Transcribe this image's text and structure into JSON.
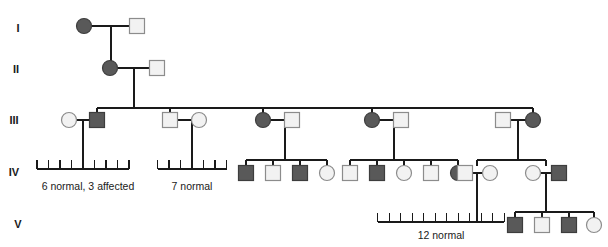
{
  "figure": {
    "type": "pedigree-chart",
    "width": 608,
    "height": 247,
    "background": "#ffffff",
    "line_color": "#1a1a1a",
    "affected_fill": "#595959",
    "unaffected_fill": "#f2f2f2",
    "symbol_stroke": "#8c8c8c",
    "affected_stroke": "#3d3d3d"
  },
  "generation_labels": [
    {
      "id": "gen-1",
      "text": "I",
      "x": 18,
      "y": 32
    },
    {
      "id": "gen-2",
      "text": "II",
      "x": 16,
      "y": 73
    },
    {
      "id": "gen-3",
      "text": "III",
      "x": 14,
      "y": 124
    },
    {
      "id": "gen-4",
      "text": "IV",
      "x": 14,
      "y": 176
    },
    {
      "id": "gen-5",
      "text": "V",
      "x": 18,
      "y": 228
    }
  ],
  "sibship_labels": [
    {
      "id": "sibship-label-1",
      "text": "6 normal, 3 affected",
      "x": 88,
      "y": 190,
      "count": 9
    },
    {
      "id": "sibship-label-2",
      "text": "7 normal",
      "x": 192,
      "y": 190,
      "count": 7
    },
    {
      "id": "sibship-label-3",
      "text": "12 normal",
      "x": 441,
      "y": 239,
      "count": 12
    }
  ],
  "individuals": [
    {
      "id": "I-1",
      "shape": "circle",
      "status": "affected",
      "x": 84,
      "y": 26,
      "generation": "I"
    },
    {
      "id": "I-2",
      "shape": "square",
      "status": "unaffected",
      "x": 137,
      "y": 26,
      "generation": "I"
    },
    {
      "id": "II-1",
      "shape": "circle",
      "status": "affected",
      "x": 110,
      "y": 68,
      "generation": "II"
    },
    {
      "id": "II-2",
      "shape": "square",
      "status": "unaffected",
      "x": 157,
      "y": 68,
      "generation": "II"
    },
    {
      "id": "III-1",
      "shape": "circle",
      "status": "unaffected",
      "x": 69,
      "y": 120,
      "generation": "III"
    },
    {
      "id": "III-2",
      "shape": "square",
      "status": "affected",
      "x": 97,
      "y": 120,
      "generation": "III"
    },
    {
      "id": "III-3",
      "shape": "square",
      "status": "unaffected",
      "x": 170,
      "y": 120,
      "generation": "III"
    },
    {
      "id": "III-4",
      "shape": "circle",
      "status": "unaffected",
      "x": 199,
      "y": 120,
      "generation": "III"
    },
    {
      "id": "III-5",
      "shape": "circle",
      "status": "affected",
      "x": 263,
      "y": 120,
      "generation": "III"
    },
    {
      "id": "III-6",
      "shape": "square",
      "status": "unaffected",
      "x": 292,
      "y": 120,
      "generation": "III"
    },
    {
      "id": "III-7",
      "shape": "circle",
      "status": "affected",
      "x": 372,
      "y": 120,
      "generation": "III"
    },
    {
      "id": "III-8",
      "shape": "square",
      "status": "unaffected",
      "x": 401,
      "y": 120,
      "generation": "III"
    },
    {
      "id": "III-9",
      "shape": "square",
      "status": "unaffected",
      "x": 503,
      "y": 120,
      "generation": "III"
    },
    {
      "id": "III-10",
      "shape": "circle",
      "status": "affected",
      "x": 533,
      "y": 120,
      "generation": "III"
    },
    {
      "id": "IV-1",
      "shape": "square",
      "status": "affected",
      "x": 246,
      "y": 173,
      "generation": "IV"
    },
    {
      "id": "IV-2",
      "shape": "square",
      "status": "unaffected",
      "x": 273,
      "y": 173,
      "generation": "IV"
    },
    {
      "id": "IV-3",
      "shape": "square",
      "status": "affected",
      "x": 300,
      "y": 173,
      "generation": "IV"
    },
    {
      "id": "IV-4",
      "shape": "circle",
      "status": "unaffected",
      "x": 327,
      "y": 173,
      "generation": "IV"
    },
    {
      "id": "IV-5",
      "shape": "square",
      "status": "unaffected",
      "x": 350,
      "y": 173,
      "generation": "IV"
    },
    {
      "id": "IV-6",
      "shape": "square",
      "status": "affected",
      "x": 377,
      "y": 173,
      "generation": "IV"
    },
    {
      "id": "IV-7",
      "shape": "circle",
      "status": "unaffected",
      "x": 404,
      "y": 173,
      "generation": "IV"
    },
    {
      "id": "IV-8",
      "shape": "square",
      "status": "unaffected",
      "x": 431,
      "y": 173,
      "generation": "IV"
    },
    {
      "id": "IV-9",
      "shape": "circle",
      "status": "affected",
      "x": 458,
      "y": 173,
      "generation": "IV"
    },
    {
      "id": "IV-10",
      "shape": "square",
      "status": "unaffected",
      "x": 465,
      "y": 173,
      "generation": "IV"
    },
    {
      "id": "IV-11",
      "shape": "circle",
      "status": "unaffected",
      "x": 490,
      "y": 173,
      "generation": "IV"
    },
    {
      "id": "IV-12",
      "shape": "circle",
      "status": "unaffected",
      "x": 533,
      "y": 173,
      "generation": "IV"
    },
    {
      "id": "IV-13",
      "shape": "square",
      "status": "affected",
      "x": 559,
      "y": 173,
      "generation": "IV"
    },
    {
      "id": "V-1",
      "shape": "square",
      "status": "affected",
      "x": 515,
      "y": 225,
      "generation": "V"
    },
    {
      "id": "V-2",
      "shape": "square",
      "status": "unaffected",
      "x": 542,
      "y": 225,
      "generation": "V"
    },
    {
      "id": "V-3",
      "shape": "square",
      "status": "affected",
      "x": 569,
      "y": 225,
      "generation": "V"
    },
    {
      "id": "V-4",
      "shape": "circle",
      "status": "unaffected",
      "x": 594,
      "y": 225,
      "generation": "V"
    }
  ],
  "connectors": {
    "mating_lines": [
      {
        "id": "mating-I",
        "x1": 92,
        "x2": 130,
        "y": 26
      },
      {
        "id": "mating-II",
        "x1": 118,
        "x2": 150,
        "y": 68
      },
      {
        "id": "mating-III-1",
        "x1": 77,
        "x2": 90,
        "y": 120
      },
      {
        "id": "mating-III-2",
        "x1": 178,
        "x2": 192,
        "y": 120
      },
      {
        "id": "mating-III-3",
        "x1": 271,
        "x2": 285,
        "y": 120
      },
      {
        "id": "mating-III-4",
        "x1": 380,
        "x2": 394,
        "y": 120
      },
      {
        "id": "mating-III-5",
        "x1": 511,
        "x2": 526,
        "y": 120
      },
      {
        "id": "mating-IV-1",
        "x1": 473,
        "x2": 483,
        "y": 173
      },
      {
        "id": "mating-IV-2",
        "x1": 541,
        "x2": 552,
        "y": 173
      }
    ],
    "sibship_bars": [
      {
        "id": "sibship-bar-III",
        "x1": 97,
        "x2": 533,
        "y": 108
      },
      {
        "id": "sibship-bar-IV-3",
        "x1": 246,
        "x2": 327,
        "y": 160
      },
      {
        "id": "sibship-bar-IV-4",
        "x1": 350,
        "x2": 458,
        "y": 160
      },
      {
        "id": "sibship-bar-IV-5",
        "x1": 477,
        "x2": 546,
        "y": 160
      },
      {
        "id": "sibship-bar-V",
        "x1": 515,
        "x2": 594,
        "y": 212
      }
    ]
  }
}
